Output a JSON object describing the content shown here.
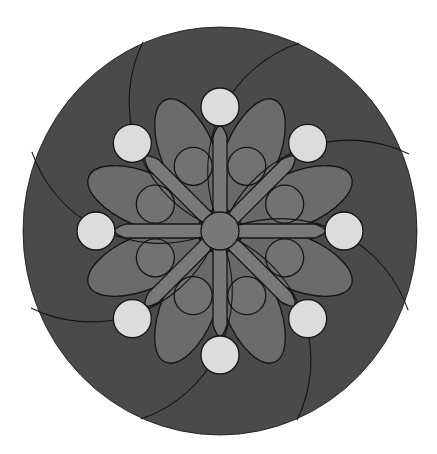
{
  "figure": {
    "type": "mandala",
    "symmetry": 8,
    "center": [
      220,
      231
    ],
    "outer_disc": {
      "rx": 197,
      "ry": 204
    },
    "colors": {
      "background": "#ffffff",
      "outer_disc": "#4a4a4a",
      "petal": "#6e6e6e",
      "spoke": "#787878",
      "inner_circle": "#727272",
      "gap": "#3c3c3c",
      "white_circle": "#dcdcdc",
      "stroke": "#141414"
    },
    "white_circles": {
      "count": 8,
      "radius": 19,
      "distance": 124,
      "start_angle_deg": 0
    },
    "inner_circles": {
      "count": 8,
      "radius": 19,
      "distance": 70,
      "start_angle_deg": 22.5
    },
    "petals": {
      "count": 8,
      "start_angle_deg": 22.5,
      "center_distance": 82,
      "rx": 60,
      "ry": 27
    },
    "spokes": {
      "count": 8,
      "start_angle_deg": 0,
      "length": 108,
      "width": 14
    },
    "center_circle": {
      "radius": 19
    },
    "spiral_arcs": {
      "count": 8,
      "start": [
        -77,
        -189
      ],
      "end": [
        -17,
        -9
      ],
      "radius": 135
    }
  }
}
